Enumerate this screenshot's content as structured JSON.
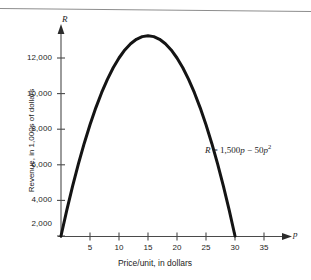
{
  "figure": {
    "background_color": "#ffffff",
    "ink_color": "#1a1a1a",
    "axis_color": "#4a4a4a",
    "rule_color": "#8d8d8d"
  },
  "axis_names": {
    "vertical": "R",
    "horizontal": "p"
  },
  "equation": {
    "lhs": "R",
    "equals": "=",
    "term1_coefficient": "1,500",
    "term1_variable": "p",
    "operator": "−",
    "term2_coefficient": "50",
    "term2_variable": "p",
    "term2_exponent": "2",
    "full_text": "R = 1,500p − 50p²"
  },
  "chart_data": {
    "type": "line",
    "title": "",
    "subtitle": "",
    "xlabel": "Price/unit, in dollars",
    "ylabel": "Revenue, in 1,000s of dollars",
    "x_axis_symbol": "p",
    "y_axis_symbol": "R",
    "equation": "R = 1,500p - 50p^2",
    "xlim": [
      0,
      38
    ],
    "ylim": [
      0,
      13500
    ],
    "xticks": [
      5,
      10,
      15,
      20,
      25,
      30,
      35
    ],
    "xtick_labels": [
      "5",
      "10",
      "15",
      "20",
      "25",
      "30",
      "35"
    ],
    "yticks": [
      2000,
      4000,
      6000,
      8000,
      10000,
      12000
    ],
    "ytick_labels": [
      "2,000",
      "4,000",
      "6,000",
      "8,000",
      "10,000",
      "12,000"
    ],
    "grid": false,
    "legend": null,
    "annotations": [
      {
        "text": "R = 1,500p − 50p²",
        "x": 25,
        "y": 5600
      }
    ],
    "axis_arrows": {
      "x_end": "arrow",
      "y_end": "arrow"
    },
    "series": [
      {
        "name": "R = 1,500p - 50p^2",
        "color": "#141414",
        "line_width": 3,
        "roots": [
          0,
          30
        ],
        "vertex": {
          "x": 15,
          "y": 11250
        },
        "x": [
          0,
          1,
          2,
          3,
          4,
          5,
          6,
          7,
          8,
          9,
          10,
          11,
          12,
          13,
          14,
          15,
          16,
          17,
          18,
          19,
          20,
          21,
          22,
          23,
          24,
          25,
          26,
          27,
          28,
          29,
          30
        ],
        "values": [
          0,
          1450,
          2800,
          4050,
          5200,
          6250,
          7200,
          8050,
          8800,
          9450,
          10000,
          10450,
          10800,
          11050,
          11200,
          11250,
          11200,
          11050,
          10800,
          10450,
          10000,
          9450,
          8800,
          8050,
          7200,
          6250,
          5200,
          4050,
          2800,
          1450,
          0
        ]
      }
    ]
  }
}
